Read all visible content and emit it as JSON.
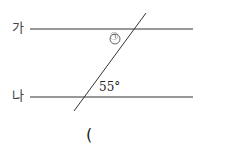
{
  "diagram": {
    "line_top_label": "가",
    "line_bottom_label": "나",
    "unknown_angle_label": "㉠",
    "given_angle": "55°",
    "answer_paren": "("
  }
}
